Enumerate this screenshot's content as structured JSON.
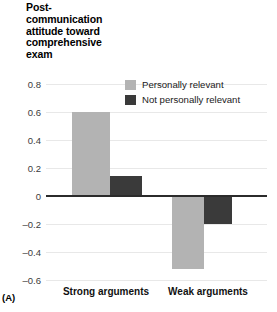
{
  "panel": {
    "label": "(A)"
  },
  "chart_data": {
    "type": "bar",
    "title_lines": [
      "Post-",
      "communication",
      "attitude toward",
      "comprehensive",
      "exam"
    ],
    "xlabel": "",
    "ylabel": "",
    "categories": [
      "Strong arguments",
      "Weak arguments"
    ],
    "series": [
      {
        "name": "Personally relevant",
        "color": "#b3b3b3",
        "values": [
          0.6,
          -0.52
        ]
      },
      {
        "name": "Not personally relevant",
        "color": "#3a3a3a",
        "values": [
          0.14,
          -0.2
        ]
      }
    ],
    "ylim": [
      -0.6,
      0.8
    ],
    "yticks": [
      0.8,
      0.6,
      0.4,
      0.2,
      0,
      -0.2,
      -0.4,
      -0.6
    ],
    "ytick_labels": [
      "0.8",
      "0.6",
      "0.4",
      "0.2",
      "0",
      "–0.2",
      "–0.4",
      "–0.6"
    ],
    "grid": true,
    "zero_line": true,
    "legend_position": "top-right"
  },
  "colors": {
    "light_gray": "#b3b3b3",
    "dark_gray": "#3a3a3a",
    "gridline": "#e8e8e8",
    "zero_line": "#2b2b2b",
    "background": "#ffffff"
  }
}
